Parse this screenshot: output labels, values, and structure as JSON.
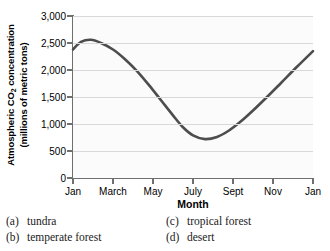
{
  "chart_data": {
    "type": "line",
    "title": "",
    "xlabel": "Month",
    "ylabel_line1": "Atmospheric CO",
    "ylabel_sub": "2",
    "ylabel_line1_rest": " concentration",
    "ylabel_line2": "(millions of metric tons)",
    "ylim": [
      0,
      3000
    ],
    "yticks": [
      0,
      500,
      1000,
      1500,
      2000,
      2500,
      3000
    ],
    "ytick_labels": [
      "0",
      "500",
      "1,000",
      "1,500",
      "2,000",
      "2,500",
      "3,000"
    ],
    "xticks": [
      1,
      3,
      5,
      7,
      9,
      11,
      13
    ],
    "xtick_labels": [
      "Jan",
      "March",
      "May",
      "July",
      "Sept",
      "Nov",
      "Jan"
    ],
    "xlim": [
      1,
      13
    ],
    "grid": true,
    "legend": "none",
    "series": [
      {
        "name": "Atmospheric CO2 concentration",
        "color": "#4d4d4d",
        "x": [
          1,
          1.4,
          1.9,
          2.4,
          3.0,
          3.6,
          4.2,
          4.8,
          5.4,
          6.0,
          6.5,
          7.0,
          7.6,
          8.2,
          8.8,
          9.4,
          10.0,
          10.7,
          11.4,
          12.2,
          13
        ],
        "values": [
          2380,
          2520,
          2560,
          2500,
          2380,
          2200,
          1980,
          1720,
          1440,
          1160,
          940,
          790,
          720,
          760,
          880,
          1050,
          1250,
          1500,
          1760,
          2060,
          2350
        ]
      }
    ],
    "annotations": []
  },
  "question_options": [
    {
      "label": "(a)",
      "text": "tundra"
    },
    {
      "label": "(b)",
      "text": "temperate forest"
    },
    {
      "label": "(c)",
      "text": "tropical forest"
    },
    {
      "label": "(d)",
      "text": "desert"
    }
  ]
}
